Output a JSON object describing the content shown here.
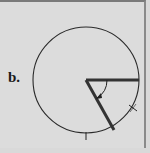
{
  "figure": {
    "label": "b.",
    "colors": {
      "background": "#dcdcdc",
      "stroke": "#2a2a2a",
      "arm": "#333333",
      "frame": "#7a7a7a"
    },
    "circle": {
      "cx": 86,
      "cy": 78,
      "r": 53
    },
    "arms": [
      {
        "name": "horizontal-arm",
        "x1": 86,
        "y1": 78,
        "x2": 139,
        "y2": 78
      },
      {
        "name": "angled-arm",
        "x1": 86,
        "y1": 78,
        "x2": 114,
        "y2": 128
      }
    ],
    "tick_marks": [
      {
        "x": 133,
        "y": 106
      },
      {
        "x": 86,
        "y": 134
      }
    ],
    "angle_arc": {
      "r": 21,
      "direction": "clockwise",
      "arrow": true
    }
  }
}
